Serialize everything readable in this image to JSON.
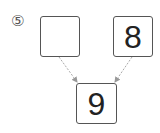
{
  "problem": {
    "label": "⑤",
    "boxes": {
      "left": "",
      "right": "8",
      "bottom": "9"
    }
  },
  "colors": {
    "border": "#555555",
    "arrow": "#999999",
    "text": "#222222"
  }
}
